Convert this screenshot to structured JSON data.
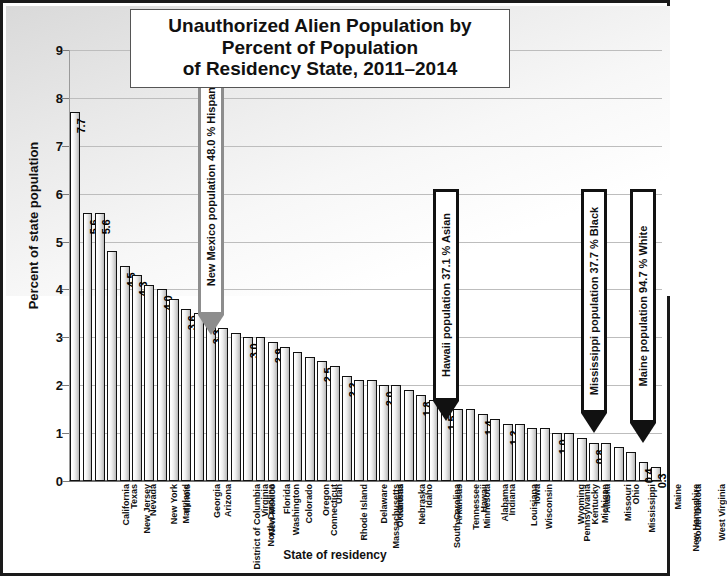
{
  "chart_data": {
    "type": "bar",
    "title": "Unauthorized Alien Population by Percent of Population of Residency State, 2011–2014",
    "title_lines": [
      "Unauthorized Alien Population by",
      "Percent of Population",
      "of Residency State, 2011–2014"
    ],
    "xlabel": "State of residency",
    "ylabel": "Percent of state population",
    "ylim": [
      0,
      9
    ],
    "ytick_labels": [
      "0",
      "1",
      "2",
      "3",
      "4",
      "5",
      "6",
      "7",
      "8",
      "9"
    ],
    "grid": true,
    "legend": "none",
    "categories": [
      "California",
      "New Jersey",
      "Texas",
      "Nevada",
      "New York",
      "Maryland",
      "Illinois",
      "District of Columbia",
      "Georgia",
      "Arizona",
      "North Carolina",
      "New Mexico",
      "Virginia",
      "Washington",
      "Florida",
      "Colorado",
      "Connecticut",
      "Oregon",
      "Rhode Island",
      "Utah",
      "Massachusetts",
      "Delaware",
      "Oklahoma",
      "Kansas",
      "Nebraska",
      "South Carolina",
      "Idaho",
      "Arkansas",
      "Tennessee",
      "Minnesota",
      "Hawaii",
      "Alabama",
      "Indiana",
      "Louisiana",
      "Wisconsin",
      "Iowa",
      "Pennsylvania",
      "Wyoming",
      "Kentucky",
      "Michigan",
      "Alaska",
      "Missouri",
      "Mississippi",
      "Ohio",
      "New Hampshire",
      "South Dakota",
      "Maine",
      "West Virginia"
    ],
    "values": [
      7.7,
      5.6,
      5.6,
      4.8,
      4.5,
      4.3,
      4.1,
      4.0,
      3.8,
      3.6,
      3.5,
      3.3,
      3.2,
      3.1,
      3.0,
      3.0,
      2.9,
      2.8,
      2.7,
      2.6,
      2.5,
      2.4,
      2.2,
      2.1,
      2.1,
      2.0,
      2.0,
      1.9,
      1.8,
      1.7,
      1.5,
      1.5,
      1.5,
      1.4,
      1.3,
      1.2,
      1.2,
      1.1,
      1.1,
      1.0,
      1.0,
      0.9,
      0.8,
      0.8,
      0.7,
      0.6,
      0.4,
      0.3
    ],
    "value_labels": [
      "7.7",
      "5.6",
      "5.6",
      "",
      "4.5",
      "4.3",
      "",
      "4.0",
      "",
      "3.6",
      "",
      "3.3",
      "",
      "",
      "3.0",
      "",
      "2.9",
      "",
      "",
      "",
      "2.5",
      "",
      "2.2",
      "",
      "",
      "2.0",
      "",
      "",
      "1.8",
      "",
      "1.5",
      "",
      "",
      "1.4",
      "",
      "1.2",
      "",
      "",
      "",
      "1.0",
      "",
      "",
      "0.8",
      "",
      "",
      "",
      "0.4",
      "0.3"
    ],
    "annotations": [
      {
        "id": "new-mexico-annotation",
        "text": "New Mexico population 48.0 % Hispanic",
        "style": "grey",
        "target_category": "New Mexico"
      },
      {
        "id": "hawaii-annotation",
        "text": "Hawaii population 37.1 % Asian",
        "style": "black",
        "target_category": "Hawaii"
      },
      {
        "id": "mississippi-annotation",
        "text": "Mississippi population 37.7 % Black",
        "style": "black",
        "target_category": "Mississippi"
      },
      {
        "id": "maine-annotation",
        "text": "Maine population 94.7 % White",
        "style": "black",
        "target_category": "Maine"
      }
    ],
    "colors": {
      "bar_fill_light": "#ffffff",
      "bar_fill_dark": "#b6b6b6",
      "bar_outline": "#111111",
      "gridline": "#bdbdbd",
      "annotation_grey": "#8d8d8d",
      "annotation_black": "#111111",
      "text": "#111111",
      "frame": "#1a1a1a"
    }
  }
}
